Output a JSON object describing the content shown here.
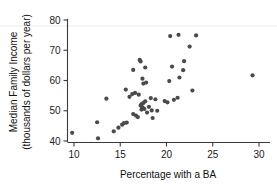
{
  "chart_data": {
    "type": "scatter",
    "title": "",
    "xlabel": "Percentage with a BA",
    "ylabel": "Median Family Income (thousands of dollars per year)",
    "ylabel_line1": "Median Family Income",
    "ylabel_line2": "(thousands of dollars per year)",
    "xlim": [
      8.4,
      31.5
    ],
    "ylim": [
      38.5,
      82.0
    ],
    "xticks": [
      10,
      15,
      20,
      25,
      30
    ],
    "xtick_labels": [
      "10",
      "15",
      "20",
      "25",
      "30"
    ],
    "yticks": [
      40,
      50,
      60,
      70,
      80
    ],
    "ytick_labels": [
      "40",
      "50",
      "60",
      "70",
      "80"
    ],
    "grid": false,
    "legend": null,
    "marker": "filled-circle",
    "marker_color": "#4a4a4a",
    "marker_size": 2.1,
    "n_points": 51,
    "points": [
      {
        "x": 9.8,
        "y": 42.7
      },
      {
        "x": 12.5,
        "y": 46.2
      },
      {
        "x": 12.6,
        "y": 40.9
      },
      {
        "x": 13.5,
        "y": 54.0
      },
      {
        "x": 14.3,
        "y": 43.2
      },
      {
        "x": 14.8,
        "y": 44.4
      },
      {
        "x": 15.2,
        "y": 45.4
      },
      {
        "x": 15.4,
        "y": 45.9
      },
      {
        "x": 15.6,
        "y": 57.0
      },
      {
        "x": 15.7,
        "y": 46.1
      },
      {
        "x": 16.0,
        "y": 54.6
      },
      {
        "x": 16.3,
        "y": 55.5
      },
      {
        "x": 16.4,
        "y": 63.5
      },
      {
        "x": 16.4,
        "y": 48.9
      },
      {
        "x": 16.6,
        "y": 55.9
      },
      {
        "x": 16.7,
        "y": 48.4
      },
      {
        "x": 16.9,
        "y": 47.9
      },
      {
        "x": 17.0,
        "y": 55.3
      },
      {
        "x": 17.1,
        "y": 66.8
      },
      {
        "x": 17.2,
        "y": 66.3
      },
      {
        "x": 17.2,
        "y": 51.7
      },
      {
        "x": 17.3,
        "y": 52.2
      },
      {
        "x": 17.3,
        "y": 50.4
      },
      {
        "x": 17.4,
        "y": 60.6
      },
      {
        "x": 17.4,
        "y": 51.1
      },
      {
        "x": 17.5,
        "y": 59.0
      },
      {
        "x": 17.5,
        "y": 52.6
      },
      {
        "x": 17.6,
        "y": 50.6
      },
      {
        "x": 17.7,
        "y": 64.3
      },
      {
        "x": 17.7,
        "y": 53.1
      },
      {
        "x": 17.8,
        "y": 59.3
      },
      {
        "x": 17.9,
        "y": 49.4
      },
      {
        "x": 18.1,
        "y": 51.3
      },
      {
        "x": 18.3,
        "y": 54.2
      },
      {
        "x": 18.4,
        "y": 50.1
      },
      {
        "x": 18.5,
        "y": 47.6
      },
      {
        "x": 18.8,
        "y": 53.8
      },
      {
        "x": 19.0,
        "y": 50.0
      },
      {
        "x": 19.8,
        "y": 53.2
      },
      {
        "x": 20.1,
        "y": 52.8
      },
      {
        "x": 20.3,
        "y": 59.8
      },
      {
        "x": 20.4,
        "y": 74.7
      },
      {
        "x": 20.6,
        "y": 64.6
      },
      {
        "x": 20.8,
        "y": 53.6
      },
      {
        "x": 21.2,
        "y": 54.3
      },
      {
        "x": 21.3,
        "y": 75.1
      },
      {
        "x": 21.4,
        "y": 61.0
      },
      {
        "x": 21.8,
        "y": 63.4
      },
      {
        "x": 21.9,
        "y": 66.4
      },
      {
        "x": 22.5,
        "y": 71.2
      },
      {
        "x": 22.8,
        "y": 56.7
      },
      {
        "x": 23.2,
        "y": 74.9
      },
      {
        "x": 29.3,
        "y": 61.7
      }
    ]
  }
}
